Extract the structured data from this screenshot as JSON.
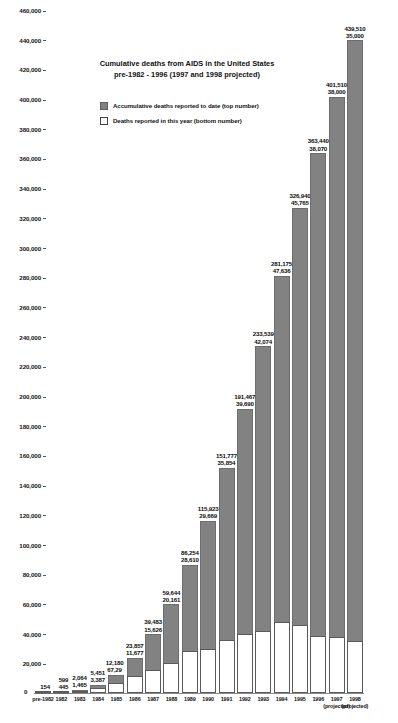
{
  "chart_data": {
    "type": "bar",
    "title": "Cumulative deaths from AIDS in the United States",
    "subtitle": "pre-1982 - 1996 (1997 and 1998 projected)",
    "xlabel": "",
    "ylabel": "",
    "ylim": [
      0,
      460000
    ],
    "ytick_step": 20000,
    "grid": false,
    "legend_position": "upper-left-inset",
    "stacked": true,
    "categories": [
      "pre-1982",
      "1982",
      "1983",
      "1984",
      "1985",
      "1986",
      "1987",
      "1988",
      "1989",
      "1990",
      "1991",
      "1992",
      "1993",
      "1994",
      "1995",
      "1996",
      "1997",
      "1998"
    ],
    "category_notes": {
      "1997": "(projected)",
      "1998": "(projected)"
    },
    "series": [
      {
        "name": "Accumulative deaths reported to date (top number)",
        "color": "#828282",
        "values": [
          154,
          599,
          2064,
          5451,
          12180,
          23857,
          39483,
          59644,
          86254,
          115923,
          151777,
          191467,
          233539,
          281175,
          326940,
          363440,
          401510,
          439510
        ]
      },
      {
        "name": "Deaths reported in this year (bottom number)",
        "color": "#ffffff",
        "values": [
          154,
          445,
          1465,
          3387,
          6729,
          11677,
          15626,
          20161,
          28610,
          29669,
          35854,
          39690,
          42074,
          47636,
          45765,
          38070,
          38000,
          35000
        ]
      }
    ],
    "labels": [
      {
        "category": "pre-1982",
        "cumulative": "154",
        "year": ""
      },
      {
        "category": "1982",
        "cumulative": "599",
        "year": "445"
      },
      {
        "category": "1983",
        "cumulative": "2,064",
        "year": "1,465"
      },
      {
        "category": "1984",
        "cumulative": "5,451",
        "year": "3,387"
      },
      {
        "category": "1985",
        "cumulative": "12,180",
        "year": "67,29"
      },
      {
        "category": "1986",
        "cumulative": "23,857",
        "year": "11,677"
      },
      {
        "category": "1987",
        "cumulative": "39,483",
        "year": "15,626"
      },
      {
        "category": "1988",
        "cumulative": "59,644",
        "year": "20,161"
      },
      {
        "category": "1989",
        "cumulative": "86,254",
        "year": "28,610"
      },
      {
        "category": "1990",
        "cumulative": "115,923",
        "year": "29,669"
      },
      {
        "category": "1991",
        "cumulative": "151,777",
        "year": "35,854"
      },
      {
        "category": "1992",
        "cumulative": "191,467",
        "year": "39,690"
      },
      {
        "category": "1993",
        "cumulative": "233,539",
        "year": "42,074"
      },
      {
        "category": "1994",
        "cumulative": "281,175",
        "year": "47,636"
      },
      {
        "category": "1995",
        "cumulative": "326,940",
        "year": "45,765"
      },
      {
        "category": "1996",
        "cumulative": "363,440",
        "year": "38,070"
      },
      {
        "category": "1997",
        "cumulative": "401,510",
        "year": "38,000"
      },
      {
        "category": "1998",
        "cumulative": "439,510",
        "year": "35,000"
      }
    ],
    "ytick_labels": [
      "460,000",
      "440,000",
      "420,000",
      "400,000",
      "380,000",
      "360,000",
      "340,000",
      "320,000",
      "300,000",
      "280,000",
      "260,000",
      "240,000",
      "220,000",
      "200,000",
      "180,000",
      "160,000",
      "140,000",
      "120,000",
      "100,000",
      "80,000",
      "60,000",
      "40,000",
      "20,000",
      "0"
    ]
  },
  "legend": {
    "items": [
      {
        "label": "Accumulative deaths reported to date (top number)",
        "swatch": "cum"
      },
      {
        "label": "Deaths reported in this year (bottom number)",
        "swatch": "year"
      }
    ]
  },
  "axis": {
    "zero_label": "0",
    "projected_note": "(projected)"
  }
}
